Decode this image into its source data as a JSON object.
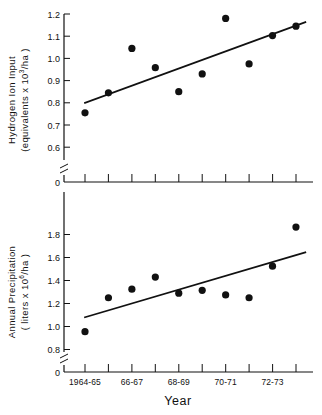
{
  "figure": {
    "xlabel": "Year",
    "panels": [
      {
        "id": "hydrogen-ion-input",
        "ylabel_line1": "Hydrogen Ion Input",
        "ylabel_line2_pre": "(equivalents  x 10",
        "ylabel_line2_sup": "3",
        "ylabel_line2_post": "/ha )",
        "yticks": [
          "1.2",
          "1.1",
          "1.0",
          "0.9",
          "0.8",
          "0.7",
          "0.6",
          "0"
        ],
        "ytick_values": [
          1.2,
          1.1,
          1.0,
          0.9,
          0.8,
          0.7,
          0.6,
          0
        ]
      },
      {
        "id": "annual-precipitation",
        "ylabel_line1": "Annual  Precipitation",
        "ylabel_line2_pre": "( liters  x 10",
        "ylabel_line2_sup": "6",
        "ylabel_line2_post": "/ha )",
        "yticks": [
          "1.8",
          "1.6",
          "1.4",
          "1.2",
          "1.0",
          "0.8",
          "0"
        ],
        "ytick_values": [
          1.8,
          1.6,
          1.4,
          1.2,
          1.0,
          0.8,
          0
        ]
      }
    ],
    "xtick_labels": [
      "1964-65",
      "",
      "66-67",
      "",
      "68-69",
      "",
      "70-71",
      "",
      "72-73",
      ""
    ],
    "colors": {
      "ink": "#111111",
      "background": "#ffffff"
    }
  },
  "chart_data": [
    {
      "type": "scatter",
      "title": "",
      "xlabel": "Year",
      "ylabel": "Hydrogen Ion Input (equivalents x 10^3/ha)",
      "categories": [
        "1964-65",
        "65-66",
        "66-67",
        "67-68",
        "68-69",
        "69-70",
        "70-71",
        "71-72",
        "72-73",
        "73-74"
      ],
      "x": [
        1,
        2,
        3,
        4,
        5,
        6,
        7,
        8,
        9,
        10
      ],
      "values": [
        0.755,
        0.845,
        1.045,
        0.958,
        0.85,
        0.93,
        1.18,
        0.975,
        1.103,
        1.145
      ],
      "ylim": [
        0.555,
        1.235
      ],
      "yticks": [
        0.6,
        0.7,
        0.8,
        0.9,
        1.0,
        1.1,
        1.2
      ],
      "axis_break": true,
      "grid": false,
      "legend": "none",
      "trendline": {
        "type": "linear",
        "x_start": 1,
        "y_start": 0.8,
        "x_end": 10.4,
        "y_end": 1.163
      }
    },
    {
      "type": "scatter",
      "title": "",
      "xlabel": "Year",
      "ylabel": "Annual Precipitation (liters x 10^6/ha)",
      "categories": [
        "1964-65",
        "65-66",
        "66-67",
        "67-68",
        "68-69",
        "69-70",
        "70-71",
        "71-72",
        "72-73",
        "73-74"
      ],
      "x": [
        1,
        2,
        3,
        4,
        5,
        6,
        7,
        8,
        9,
        10
      ],
      "values": [
        0.955,
        1.25,
        1.325,
        1.43,
        1.29,
        1.315,
        1.275,
        1.25,
        1.525,
        1.865
      ],
      "ylim": [
        0.72,
        1.93
      ],
      "yticks": [
        0.8,
        1.0,
        1.2,
        1.4,
        1.6,
        1.8
      ],
      "axis_break": true,
      "grid": false,
      "legend": "none",
      "trendline": {
        "type": "linear",
        "x_start": 1,
        "y_start": 1.08,
        "x_end": 10.4,
        "y_end": 1.645
      }
    }
  ]
}
